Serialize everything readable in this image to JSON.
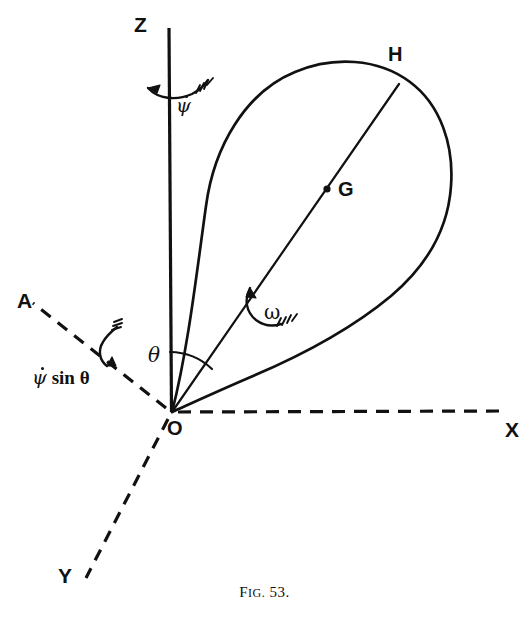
{
  "figure": {
    "caption_prefix": "F",
    "caption_smallcaps": "IG.",
    "caption_number": "53.",
    "caption_full": "FIG. 53.",
    "background_color": "#ffffff",
    "ink_color": "#111111"
  },
  "axes": [
    {
      "id": "z",
      "label": "Z",
      "style": "solid",
      "description": "vertical spin/space axis"
    },
    {
      "id": "x",
      "label": "X",
      "style": "dashed",
      "description": "horizontal axis to the right"
    },
    {
      "id": "y",
      "label": "Y",
      "style": "dashed",
      "description": "axis toward lower left"
    },
    {
      "id": "a",
      "label": "A",
      "style": "dashed",
      "description": "line of nodes toward upper left"
    }
  ],
  "points": [
    {
      "id": "o",
      "label": "O",
      "description": "origin, fixed point of the body"
    },
    {
      "id": "g",
      "label": "G",
      "description": "centre of gravity on line OH"
    },
    {
      "id": "h",
      "label": "H",
      "description": "point on body surface along axis OH"
    }
  ],
  "angles": [
    {
      "id": "theta",
      "label": "θ",
      "description": "angle between Z axis and body axis OH"
    }
  ],
  "vectors": [
    {
      "id": "psi-dot",
      "label": "ψ",
      "dot": true,
      "description": "precession rate about Z axis"
    },
    {
      "id": "psi-dot-sin-theta",
      "base": "ψ",
      "dot": true,
      "suffix": " sin θ",
      "description": "component of precession along OA"
    },
    {
      "id": "omega",
      "label": "ω",
      "dot": false,
      "description": "angular velocity about body axis OH"
    }
  ]
}
